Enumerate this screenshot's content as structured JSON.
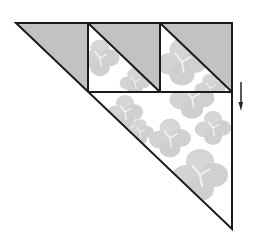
{
  "diagram": {
    "type": "quilt-block-layout",
    "colors": {
      "gray_fabric": "#c2c2c2",
      "floral_fabric_bg": "#ffffff",
      "floral_motif": "#d4d4d4",
      "outline": "#1a1a1a"
    },
    "top_row": {
      "pieces": [
        {
          "kind": "gray-triangle",
          "position": "left end"
        },
        {
          "kind": "half-square-triangle",
          "top": "gray",
          "bottom": "floral"
        },
        {
          "kind": "half-square-triangle",
          "top": "gray",
          "bottom": "floral"
        }
      ]
    },
    "bottom_piece": {
      "kind": "large-floral-triangle"
    },
    "arrow": {
      "direction": "down",
      "meaning": "pressing direction"
    }
  }
}
